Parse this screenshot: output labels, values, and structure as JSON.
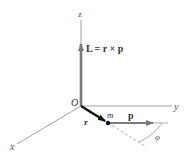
{
  "diagram": {
    "axes": {
      "z_label": "z",
      "y_label": "y",
      "x_label": "x",
      "origin_label": "O"
    },
    "vectors": {
      "L_equation": "L = r × p",
      "r_label": "r",
      "p_label": "p"
    },
    "particle_label": "m",
    "angle_label": "φ",
    "colors": {
      "axis": "#8a8a8a",
      "vector_gray": "#7a7a7a",
      "r_vector": "#111111",
      "text": "#333333"
    }
  }
}
